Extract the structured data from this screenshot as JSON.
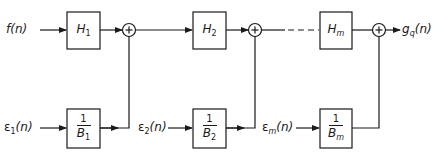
{
  "diagram": {
    "type": "block-diagram",
    "inputs": {
      "f": {
        "name": "f",
        "arg": "(n)"
      },
      "e1": {
        "name": "ε",
        "sub": "1",
        "arg": "(n)"
      },
      "e2": {
        "name": "ε",
        "sub": "2",
        "arg": "(n)"
      },
      "em": {
        "name": "ε",
        "sub": "m",
        "arg": "(n)"
      }
    },
    "output": {
      "name": "g",
      "sub": "q",
      "arg": "(n)"
    },
    "top_blocks": [
      {
        "name": "H",
        "sub": "1"
      },
      {
        "name": "H",
        "sub": "2"
      },
      {
        "name": "H",
        "sub": "m"
      }
    ],
    "bottom_blocks": [
      {
        "num": "1",
        "den": "B",
        "sub": "1"
      },
      {
        "num": "1",
        "den": "B",
        "sub": "2"
      },
      {
        "num": "1",
        "den": "B",
        "sub": "m"
      }
    ],
    "summing_junction_symbol": "+",
    "colors": {
      "line": "#1a1a1a",
      "background": "#ffffff"
    }
  }
}
